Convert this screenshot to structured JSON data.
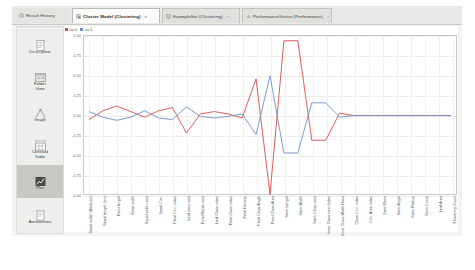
{
  "window": {
    "background": "#ffffff"
  },
  "tabs": [
    {
      "label": "Result History",
      "icon": "history-icon",
      "selected": false,
      "closable": false
    },
    {
      "label": "Cluster Model (Clustering)",
      "icon": "cluster-model-icon",
      "selected": true,
      "closable": true
    },
    {
      "label": "ExampleSet (Clustering)",
      "icon": "exampleset-icon",
      "selected": false,
      "closable": true
    },
    {
      "label": "PerformanceVector (Performance)",
      "icon": "performance-icon",
      "selected": false,
      "closable": true
    }
  ],
  "sidebar": {
    "items": [
      {
        "label": "Description",
        "icon": "description-icon",
        "selected": false
      },
      {
        "label": "Folder\nView",
        "icon": "folder-view-icon",
        "selected": false
      },
      {
        "label": "Graph",
        "icon": "graph-icon",
        "selected": false
      },
      {
        "label": "Centroid\nTable",
        "icon": "centroid-table-icon",
        "selected": false
      },
      {
        "label": "Plot",
        "icon": "plot-icon",
        "selected": true
      },
      {
        "label": "Annotations",
        "icon": "annotations-icon",
        "selected": false
      }
    ]
  },
  "colors": {
    "series_0": "#d94b4b",
    "series_1": "#6f8fd0",
    "grid": "#f0f0ee",
    "axis": "#c9c9c6",
    "selection": "#c9c9c4"
  },
  "chart_data": {
    "type": "line",
    "title": "",
    "xlabel": "",
    "ylabel": "",
    "grid": true,
    "legend_position": "top-left",
    "ylim": [
      -1.0,
      1.0
    ],
    "yticks": [
      "1.00",
      "0.75",
      "0.50",
      "0.25",
      "0.00",
      "-0.25",
      "-0.50",
      "-0.75",
      "-1.00"
    ],
    "ytick_values": [
      1.0,
      0.75,
      0.5,
      0.25,
      0.0,
      -0.25,
      -0.5,
      -0.75,
      -1.0
    ],
    "categories": [
      "Sepal width (Attribute)",
      "Sepal length (cm)",
      "Petal length",
      "Petal width",
      "Sepal width ratio",
      "Sepal Circ.",
      "Petal Circ. index",
      "Leaf area ratio",
      "Petal/Sepal ratio",
      "Leaf Class index",
      "Petal Class index",
      "Petal Density",
      "Petal Class Angle",
      "Petal Class Area",
      "Stem Length",
      "Stem Width",
      "Stem Class ratio",
      "Inner Class ratio Index",
      "Inner Class Width Ratio",
      "Class Circ. index",
      "Circ. Area index",
      "Stem Ratio",
      "Stem Angle",
      "Stem Radius",
      "Stem Curve",
      "Leaf Area",
      "Flowering Count"
    ],
    "series": [
      {
        "name": "av.0",
        "color": "#d94b4b",
        "values": [
          -0.05,
          0.06,
          0.12,
          0.05,
          -0.02,
          0.06,
          0.1,
          -0.22,
          0.02,
          0.05,
          0.02,
          -0.03,
          0.46,
          -0.99,
          0.94,
          0.94,
          -0.31,
          -0.31,
          0.03,
          0.0,
          0.0,
          0.0,
          0.0,
          0.0,
          0.0,
          0.0,
          0.0
        ]
      },
      {
        "name": "av.1",
        "color": "#6f8fd0",
        "values": [
          0.05,
          -0.02,
          -0.06,
          -0.02,
          0.06,
          -0.03,
          -0.05,
          0.11,
          -0.01,
          -0.03,
          -0.01,
          0.02,
          -0.24,
          0.5,
          -0.47,
          -0.47,
          0.16,
          0.16,
          -0.02,
          0.0,
          0.0,
          0.0,
          0.0,
          0.0,
          0.0,
          0.0,
          0.0
        ]
      }
    ]
  }
}
